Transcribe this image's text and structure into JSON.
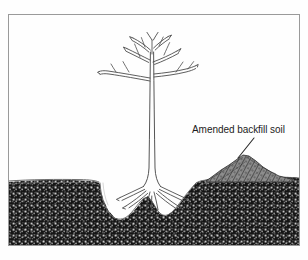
{
  "figure": {
    "background_color": "#fefefe",
    "frame": {
      "name": "illustration-border",
      "stroke_color": "#9a9a9a",
      "x": 8,
      "y": 14,
      "width": 292,
      "height": 232
    }
  },
  "annotations": {
    "backfill_label": {
      "text": "Amended backfill soil",
      "x": 192,
      "y": 133,
      "font_size": 10,
      "color": "#1c1c1c"
    },
    "leader_line": {
      "from_x": 254,
      "from_y": 138,
      "to_x": 238,
      "to_y": 158,
      "color": "#2a2a2a"
    }
  },
  "scene": {
    "ground_level_y": 180,
    "soil": {
      "name": "native-soil",
      "fill_color": "#1a1a1a",
      "speckle_color": "#f2f2f2",
      "surface_line_color": "#4a4a4a"
    },
    "mound": {
      "name": "amended-backfill-mound",
      "fill_color": "#6e6e6e",
      "hatch_color": "#262626",
      "peak_x": 245,
      "peak_y": 155,
      "left_x": 206,
      "right_x": 292
    },
    "planting_hole": {
      "name": "planting-hole",
      "left_x": 100,
      "right_x": 196,
      "bottom_y": 222
    },
    "tree": {
      "name": "bare-root-sapling",
      "line_color": "#4c4c4c",
      "trunk_x": 152,
      "crown_top_y": 32,
      "root_flare_y": 186
    }
  }
}
